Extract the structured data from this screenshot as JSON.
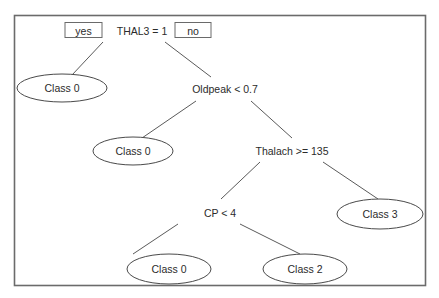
{
  "diagram": {
    "type": "decision-tree",
    "colors": {
      "frame": "#6b6b6b",
      "edge": "#5a5a5a",
      "text": "#2b2b2b",
      "background": "#ffffff"
    },
    "branch_labels": {
      "yes": "yes",
      "no": "no"
    },
    "nodes": {
      "root": {
        "label": "THAL3 = 1",
        "kind": "decision"
      },
      "leaf_class0_a": {
        "label": "Class 0",
        "kind": "leaf"
      },
      "oldpeak": {
        "label": "Oldpeak < 0.7",
        "kind": "decision"
      },
      "leaf_class0_b": {
        "label": "Class 0",
        "kind": "leaf"
      },
      "thalach": {
        "label": "Thalach >= 135",
        "kind": "decision"
      },
      "cp": {
        "label": "CP < 4",
        "kind": "decision"
      },
      "leaf_class3": {
        "label": "Class 3",
        "kind": "leaf"
      },
      "leaf_class0_c": {
        "label": "Class 0",
        "kind": "leaf"
      },
      "leaf_class2": {
        "label": "Class 2",
        "kind": "leaf"
      }
    },
    "edges": [
      {
        "from": "root",
        "to": "leaf_class0_a",
        "branch": "yes"
      },
      {
        "from": "root",
        "to": "oldpeak",
        "branch": "no"
      },
      {
        "from": "oldpeak",
        "to": "leaf_class0_b",
        "branch": "yes"
      },
      {
        "from": "oldpeak",
        "to": "thalach",
        "branch": "no"
      },
      {
        "from": "thalach",
        "to": "cp",
        "branch": "yes"
      },
      {
        "from": "thalach",
        "to": "leaf_class3",
        "branch": "no"
      },
      {
        "from": "cp",
        "to": "leaf_class0_c",
        "branch": "yes"
      },
      {
        "from": "cp",
        "to": "leaf_class2",
        "branch": "no"
      }
    ]
  }
}
